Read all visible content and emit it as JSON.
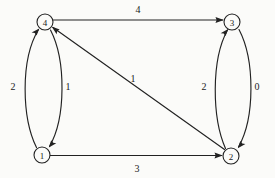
{
  "figure": {
    "type": "directed-weighted-graph",
    "background_color": "#fbfbf9",
    "stroke_color": "#222222",
    "width": 275,
    "height": 178
  },
  "nodes": [
    {
      "id": "1",
      "label": "1",
      "cx": 42,
      "cy": 155,
      "r": 8
    },
    {
      "id": "2",
      "label": "2",
      "cx": 231,
      "cy": 156,
      "r": 8
    },
    {
      "id": "3",
      "label": "3",
      "cx": 232,
      "cy": 22,
      "r": 8
    },
    {
      "id": "4",
      "label": "4",
      "cx": 45,
      "cy": 22,
      "r": 8
    }
  ],
  "edges": [
    {
      "from": "4",
      "to": "3",
      "weight": "4",
      "shape": "straight",
      "label_x": 138,
      "label_y": 9
    },
    {
      "from": "1",
      "to": "2",
      "weight": "3",
      "shape": "straight",
      "label_x": 137,
      "label_y": 168
    },
    {
      "from": "1",
      "to": "4",
      "weight": "2",
      "shape": "curve-left-outer",
      "label_x": 13,
      "label_y": 86
    },
    {
      "from": "4",
      "to": "1",
      "weight": "1",
      "shape": "curve-left-inner",
      "label_x": 68,
      "label_y": 86
    },
    {
      "from": "2",
      "to": "3",
      "weight": "2",
      "shape": "curve-right-inner",
      "label_x": 204,
      "label_y": 86
    },
    {
      "from": "3",
      "to": "2",
      "weight": "0",
      "shape": "curve-right-outer",
      "label_x": 257,
      "label_y": 86
    },
    {
      "from": "2",
      "to": "4",
      "weight": "1",
      "shape": "diagonal",
      "label_x": 133,
      "label_y": 78
    }
  ]
}
